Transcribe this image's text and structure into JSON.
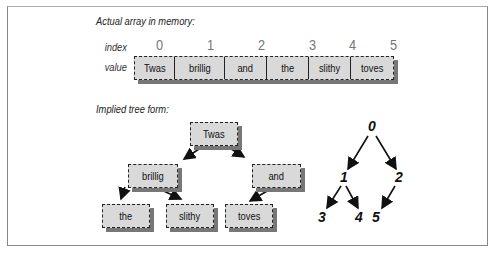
{
  "captions": {
    "array": "Actual array in memory:",
    "tree": "Implied tree form:"
  },
  "labels": {
    "index": "index",
    "value": "value"
  },
  "array": [
    {
      "index": "0",
      "value": "Twas"
    },
    {
      "index": "1",
      "value": "brillig"
    },
    {
      "index": "2",
      "value": "and"
    },
    {
      "index": "3",
      "value": "the"
    },
    {
      "index": "4",
      "value": "slithy"
    },
    {
      "index": "5",
      "value": "toves"
    }
  ],
  "tree": {
    "nodes": [
      "Twas",
      "brillig",
      "and",
      "the",
      "slithy",
      "toves"
    ],
    "edges": [
      [
        0,
        1
      ],
      [
        0,
        2
      ],
      [
        1,
        3
      ],
      [
        1,
        4
      ],
      [
        2,
        5
      ]
    ]
  },
  "index_tree": {
    "nodes": [
      "0",
      "1",
      "2",
      "3",
      "4",
      "5"
    ]
  }
}
